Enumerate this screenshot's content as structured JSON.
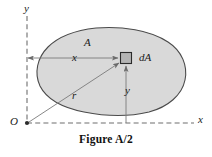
{
  "figure": {
    "caption": "Figure A/2",
    "type": "engineering-diagram",
    "background_color": "#ffffff",
    "labels": {
      "axis_y": "y",
      "axis_x": "x",
      "origin": "O",
      "area": "A",
      "distance_x": "x",
      "distance_y": "y",
      "radius_r": "r",
      "differential_area": "dA"
    },
    "colors": {
      "area_fill": "#d9d9d9",
      "area_outline": "#4a4a4a",
      "element_fill": "#b4b4b4",
      "element_outline": "#2b2b2b",
      "axis_line": "#6e6e6e",
      "dimension_line": "#7a7a7a",
      "text": "#1a1a1a"
    },
    "geometry": {
      "origin_point": [
        27,
        123
      ],
      "y_axis": {
        "x": 27,
        "y_top": 16,
        "y_bottom": 123,
        "style": "dashed"
      },
      "x_axis": {
        "y": 123,
        "x_left": 27,
        "x_right": 194,
        "style": "dashed"
      },
      "element_square": {
        "cx": 126,
        "cy": 58,
        "size": 11
      },
      "area_blob_bounds": {
        "x_min": 38,
        "y_min": 28,
        "x_max": 186,
        "y_max": 114
      },
      "dimension_x_line": {
        "from": [
          27,
          58
        ],
        "to": [
          119,
          58
        ]
      },
      "dimension_y_line": {
        "from": [
          126,
          123
        ],
        "to": [
          126,
          65
        ]
      },
      "radius_line": {
        "from": [
          27,
          123
        ],
        "to": [
          120,
          63
        ]
      }
    }
  }
}
